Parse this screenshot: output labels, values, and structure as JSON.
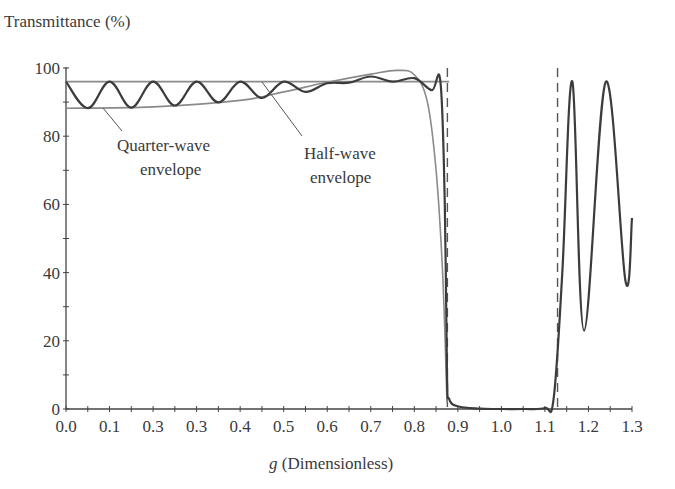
{
  "chart_data": {
    "type": "line",
    "title": "",
    "ylabel": "Transmittance (%)",
    "xlabel_italic": "g",
    "xlabel_rest": " (Dimensionless)",
    "xlabel": "g (Dimensionless)",
    "xlim": [
      0.0,
      1.3
    ],
    "ylim": [
      0,
      100
    ],
    "grid": false,
    "legend": "none (inline annotations)",
    "x_tick_labels": [
      "0.0",
      "0.1",
      "0.3",
      "0.3",
      "0.4",
      "0.5",
      "0.6",
      "0.7",
      "0.8",
      "0.9",
      "1.0",
      "1.1",
      "1.2",
      "1.3"
    ],
    "x_tick_positions": [
      0.0,
      0.1,
      0.2,
      0.3,
      0.4,
      0.5,
      0.6,
      0.7,
      0.8,
      0.9,
      1.0,
      1.1,
      1.2,
      1.3
    ],
    "y_tick_labels": [
      "0",
      "20",
      "40",
      "60",
      "80",
      "100"
    ],
    "y_tick_positions": [
      0,
      20,
      40,
      60,
      80,
      100
    ],
    "y_minor_ticks": [
      10,
      30,
      50,
      70,
      90
    ],
    "dashed_lines_x": [
      0.876,
      1.129
    ],
    "annotations": [
      {
        "lines": [
          "Quarter-wave",
          "envelope"
        ],
        "points_to": {
          "x": 0.13,
          "y": 88.5
        }
      },
      {
        "lines": [
          "Half-wave",
          "envelope"
        ],
        "points_to": {
          "x": 0.46,
          "y": 95.5
        }
      }
    ],
    "series": [
      {
        "name": "Transmittance",
        "style": "solid dark",
        "x": [
          0.0,
          0.05,
          0.1,
          0.15,
          0.2,
          0.25,
          0.3,
          0.35,
          0.4,
          0.45,
          0.5,
          0.55,
          0.6,
          0.65,
          0.7,
          0.75,
          0.8,
          0.84,
          0.86,
          0.87,
          0.875,
          0.88,
          0.9,
          0.95,
          1.0,
          1.05,
          1.1,
          1.12,
          1.14,
          1.163,
          1.19,
          1.24,
          1.285,
          1.3
        ],
        "y": [
          96,
          88.2,
          96,
          88.4,
          96,
          89,
          96,
          89.9,
          96,
          91.2,
          96,
          93,
          95.5,
          95.7,
          97.5,
          96,
          97,
          93.5,
          96,
          60,
          10,
          3,
          0.8,
          0.1,
          0,
          0,
          0.3,
          3,
          40,
          96,
          23,
          96,
          37.5,
          56
        ]
      },
      {
        "name": "Half-wave envelope (upper, flat)",
        "style": "solid gray",
        "x": [
          0.0,
          0.88
        ],
        "y": [
          96,
          96
        ]
      },
      {
        "name": "Quarter-wave envelope (lower, rising)",
        "style": "solid gray",
        "x": [
          0.0,
          0.2,
          0.4,
          0.5,
          0.6,
          0.7,
          0.76,
          0.8,
          0.83,
          0.85,
          0.865,
          0.875
        ],
        "y": [
          88.2,
          88.6,
          90.5,
          93,
          95.8,
          98.2,
          99.3,
          98,
          90,
          70,
          40,
          2
        ]
      }
    ]
  },
  "labels": {
    "ylabel": "Transmittance (%)",
    "xlabel_g": "g",
    "xlabel_rest": " (Dimensionless)",
    "quarter_line1": "Quarter-wave",
    "quarter_line2": "envelope",
    "half_line1": "Half-wave",
    "half_line2": "envelope"
  }
}
